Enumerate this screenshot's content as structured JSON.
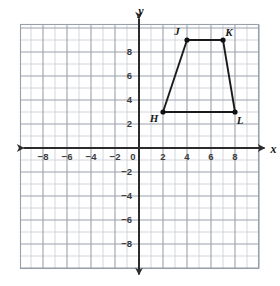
{
  "chart_data": {
    "type": "scatter",
    "title": "",
    "xlabel": "x",
    "ylabel": "y",
    "xlim": [
      -9.8,
      9.8
    ],
    "ylim": [
      -9.8,
      9.8
    ],
    "grid": true,
    "grid_step": 1,
    "major_grid_step": 2,
    "legend": "none",
    "x_tick_labels": [
      "-8",
      "-6",
      "-4",
      "-2",
      "0",
      "2",
      "4",
      "6",
      "8"
    ],
    "x_tick_values": [
      -8,
      -6,
      -4,
      -2,
      0,
      2,
      4,
      6,
      8
    ],
    "y_tick_labels": [
      "8",
      "6",
      "4",
      "2",
      "-2",
      "-4",
      "-6",
      "-8"
    ],
    "y_tick_values": [
      8,
      6,
      4,
      2,
      -2,
      -4,
      -6,
      -8
    ],
    "origin_label": "0",
    "shape": {
      "name": "HJKL",
      "kind": "trapezoid",
      "closed": true,
      "vertices": [
        {
          "label": "H",
          "x": 2,
          "y": 3,
          "label_dx": -9,
          "label_dy": 10
        },
        {
          "label": "J",
          "x": 4,
          "y": 9,
          "label_dx": -10,
          "label_dy": -5
        },
        {
          "label": "K",
          "x": 7,
          "y": 9,
          "label_dx": 6,
          "label_dy": -4
        },
        {
          "label": "L",
          "x": 8,
          "y": 3,
          "label_dx": 5,
          "label_dy": 12
        }
      ]
    }
  },
  "colors": {
    "background": "#ffffff",
    "grid_minor": "#c9ccd4",
    "grid_major": "#9aa0ab",
    "axis": "#2b2b2b",
    "shape_stroke": "#1a1a1a",
    "vertex_fill": "#111111",
    "tick_text": "#3b3b3b"
  },
  "axes": {
    "x_axis_name": "x",
    "y_axis_name": "y"
  }
}
